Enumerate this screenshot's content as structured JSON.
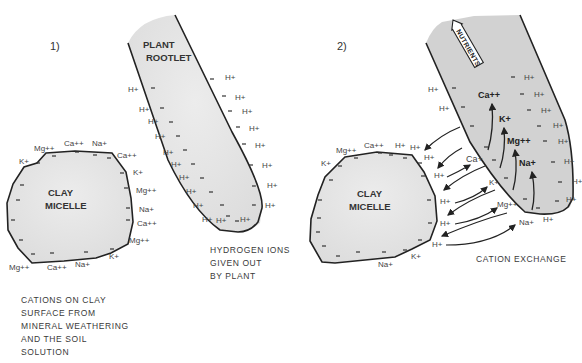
{
  "panel1": {
    "number": "1)",
    "rootlet_label": [
      "PLANT",
      "ROOTLET"
    ],
    "micelle_label": [
      "CLAY",
      "MICELLE"
    ],
    "clay_cations": [
      "Mg++",
      "Ca++",
      "Na+",
      "Ca++",
      "K+",
      "Mg++",
      "Na+",
      "Ca++",
      "Mg++",
      "K+",
      "Na+",
      "Ca++",
      "Mg++",
      "K+"
    ],
    "root_ions": "H+",
    "caption_hydrogen": [
      "HYDROGEN IONS",
      "GIVEN OUT",
      "BY PLANT"
    ],
    "caption_cations": [
      "CATIONS ON CLAY",
      "SURFACE FROM",
      "MINERAL WEATHERING",
      "AND THE SOIL",
      "SOLUTION"
    ]
  },
  "panel2": {
    "number": "2)",
    "nutrients_label": "NUTRIENTS",
    "micelle_label": [
      "CLAY",
      "MICELLE"
    ],
    "clay_cations": [
      "Mg++",
      "Ca++",
      "H+",
      "H+",
      "K+",
      "Na+",
      "K+"
    ],
    "exchange_h": [
      "H+",
      "H+",
      "H+",
      "H+",
      "H+"
    ],
    "exchanged_cations": [
      "Ca+",
      "K+",
      "Mg++",
      "Na+"
    ],
    "root_interior_ions": [
      "Ca++",
      "K+",
      "Mg++",
      "Na+"
    ],
    "root_ions": "H+",
    "caption": "CATION EXCHANGE"
  },
  "colors": {
    "outline": "#222222",
    "clay_fill": "#e3e3e3",
    "root_fill_1": "#e6e6e6",
    "root_fill_2": "#cfcfcf"
  }
}
